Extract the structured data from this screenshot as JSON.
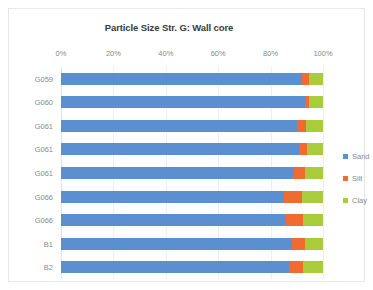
{
  "chart_data": {
    "type": "bar",
    "orientation": "horizontal",
    "stacked": true,
    "normalized_percent": true,
    "title": "Particle Size Str. G: Wall core",
    "xlabel": "",
    "ylabel": "",
    "xlim": [
      0,
      100
    ],
    "x_tick_labels": [
      "0%",
      "20%",
      "40%",
      "60%",
      "80%",
      "100%"
    ],
    "x_tick_values": [
      0,
      20,
      40,
      60,
      80,
      100
    ],
    "grid": true,
    "legend_position": "right",
    "categories": [
      "G059",
      "G060",
      "G061",
      "G061",
      "G061",
      "G066",
      "G066",
      "B1",
      "B2"
    ],
    "series": [
      {
        "name": "Sand",
        "color": "#5b8fd0",
        "values": [
          92,
          93,
          90,
          91,
          89,
          85,
          86,
          88,
          87
        ]
      },
      {
        "name": "Silt",
        "color": "#ef6b30",
        "values": [
          2.5,
          1.5,
          3.5,
          3.0,
          4.0,
          7.0,
          6.5,
          5.0,
          5.5
        ]
      },
      {
        "name": "Clay",
        "color": "#a9cd3a",
        "values": [
          5.5,
          5.5,
          6.5,
          6.0,
          7.0,
          8.0,
          7.5,
          7.0,
          7.5
        ]
      }
    ]
  },
  "legend": {
    "items": [
      {
        "label": "Sand",
        "color": "#5b8fd0"
      },
      {
        "label": "Silt",
        "color": "#ef6b30"
      },
      {
        "label": "Clay",
        "color": "#a9cd3a"
      }
    ]
  }
}
